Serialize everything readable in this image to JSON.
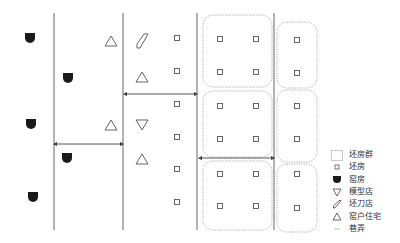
{
  "diagram": {
    "title": "",
    "colors": {
      "line": "#666666",
      "arrow": "#444444",
      "kiln": "#1a1a1a",
      "dotted_group": "#999999",
      "symbol_stroke": "#555555"
    },
    "streets_x": [
      54,
      123,
      197,
      274
    ],
    "street_y_range": [
      13,
      230
    ],
    "arrows": [
      {
        "x1": 55,
        "x2": 122,
        "y": 144
      },
      {
        "x1": 125,
        "x2": 196,
        "y": 94
      },
      {
        "x1": 200,
        "x2": 273,
        "y": 158
      }
    ],
    "groups": [
      {
        "x": 203,
        "y": 15,
        "w": 69,
        "h": 72
      },
      {
        "x": 203,
        "y": 91,
        "w": 69,
        "h": 66
      },
      {
        "x": 203,
        "y": 161,
        "w": 69,
        "h": 69
      },
      {
        "x": 277,
        "y": 22,
        "w": 40,
        "h": 66
      },
      {
        "x": 277,
        "y": 90,
        "w": 40,
        "h": 72
      },
      {
        "x": 277,
        "y": 164,
        "w": 40,
        "h": 68
      }
    ],
    "kilns": [
      {
        "x": 30,
        "y": 38
      },
      {
        "x": 31,
        "y": 124
      },
      {
        "x": 33,
        "y": 197
      },
      {
        "x": 68,
        "y": 78
      },
      {
        "x": 67,
        "y": 158
      }
    ],
    "residences": [
      {
        "x": 111,
        "y": 41
      },
      {
        "x": 111,
        "y": 125
      },
      {
        "x": 142,
        "y": 77
      },
      {
        "x": 142,
        "y": 159
      }
    ],
    "mold_shops": [
      {
        "x": 142,
        "y": 125
      }
    ],
    "knife_shops": [
      {
        "x": 142,
        "y": 41
      }
    ],
    "blank_houses": [
      {
        "x": 177,
        "y": 38
      },
      {
        "x": 177,
        "y": 71
      },
      {
        "x": 177,
        "y": 104
      },
      {
        "x": 177,
        "y": 137
      },
      {
        "x": 177,
        "y": 169
      },
      {
        "x": 177,
        "y": 202
      },
      {
        "x": 220,
        "y": 39
      },
      {
        "x": 256,
        "y": 39
      },
      {
        "x": 220,
        "y": 72
      },
      {
        "x": 256,
        "y": 72
      },
      {
        "x": 220,
        "y": 106
      },
      {
        "x": 256,
        "y": 106
      },
      {
        "x": 220,
        "y": 139
      },
      {
        "x": 256,
        "y": 139
      },
      {
        "x": 220,
        "y": 174
      },
      {
        "x": 256,
        "y": 174
      },
      {
        "x": 220,
        "y": 206
      },
      {
        "x": 256,
        "y": 206
      },
      {
        "x": 297,
        "y": 40
      },
      {
        "x": 297,
        "y": 73
      },
      {
        "x": 297,
        "y": 106
      },
      {
        "x": 297,
        "y": 139
      },
      {
        "x": 297,
        "y": 174
      },
      {
        "x": 297,
        "y": 208
      }
    ]
  },
  "legend": {
    "items": [
      {
        "symbol": "blank-house-group-icon",
        "label": "坯房群"
      },
      {
        "symbol": "blank-house-icon",
        "label": "坯房"
      },
      {
        "symbol": "kiln-icon",
        "label": "窑房"
      },
      {
        "symbol": "mold-shop-icon",
        "label": "模型店"
      },
      {
        "symbol": "knife-shop-icon",
        "label": "坯刀店"
      },
      {
        "symbol": "residence-icon",
        "label": "窑户住宅"
      },
      {
        "symbol": "alley-icon",
        "label": "巷弄"
      }
    ]
  }
}
